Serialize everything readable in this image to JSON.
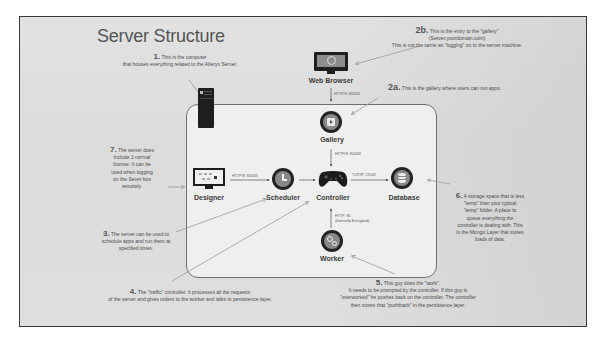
{
  "title": "Server Structure",
  "nodes": {
    "web_browser": "Web Browser",
    "gallery": "Gallery",
    "designer": "Designer",
    "scheduler": "Scheduler",
    "controller": "Controller",
    "database": "Database",
    "worker": "Worker"
  },
  "protocols": {
    "browser_to_gallery": "HTTP/S: 80/443",
    "gallery_to_controller": "HTTP/S: 80/443",
    "designer_to_scheduler": "HTTP/S: 80/443",
    "controller_to_database": "TCP/IP: 27018",
    "worker_to_controller_line1": "HTTP: 80",
    "worker_to_controller_line2": "(Internally Encrypted)"
  },
  "notes": {
    "n1": {
      "num": "1.",
      "text": "This is the computer",
      "text2": "that houses everything related to the Alteryx Server."
    },
    "n2b": {
      "num": "2b.",
      "text": "This is the entry to the \"gallery\"",
      "text2": "(Server.yourdomain.com)",
      "text3": "This is not the same as \"logging\" on to the server machine."
    },
    "n2a": {
      "num": "2a.",
      "text": "This is the gallery where users can run apps."
    },
    "n7": {
      "num": "7.",
      "text": "The server does",
      "text2": "include 1 normal",
      "text3": "license. It can be",
      "text4": "used when logging",
      "text5": "on the Sever box",
      "text6": "remotely."
    },
    "n3": {
      "num": "3.",
      "text": "The server can be used to",
      "text2": "schedule apps and run them at",
      "text3": "specified times."
    },
    "n4": {
      "num": "4.",
      "text": "The \"traffic\" controller. It processes all the requests",
      "text2": "of the server and gives orders to the worker and talks to persistence layer."
    },
    "n5": {
      "num": "5.",
      "text": "This guy does the \"work\".",
      "text2": "It needs to be prompted by the controller. If this guy is",
      "text3": "\"overworked\" he pushes back on the controller. The controller",
      "text4": "then stores that \"pushback\" in the persistence layer."
    },
    "n6": {
      "num": "6.",
      "text": "A storage space that is less",
      "text2": "\"temp\" than your typical",
      "text3": "\"temp\" folder. A place to",
      "text4": "queue everything the",
      "text5": "controller is dealing with. This",
      "text6": "is the Mongo Layer that stores",
      "text7": "loads of data."
    }
  },
  "colors": {
    "frame_border": "#3a3a3a",
    "node_ring": "#222222",
    "node_fill": "#888888",
    "arrow": "#9a9a9a",
    "connector": "#555555"
  }
}
